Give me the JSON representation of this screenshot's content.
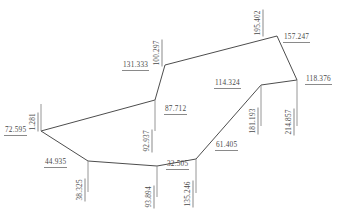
{
  "diagram": {
    "line_color": "#4d4d4d",
    "text_color": "#4a4a4a",
    "underline_color": "#8a8a8a",
    "background": "#ffffff",
    "vertices": [
      {
        "id": "v1",
        "x": 41,
        "y": 131
      },
      {
        "id": "v2",
        "x": 155,
        "y": 100
      },
      {
        "id": "v3",
        "x": 165,
        "y": 65
      },
      {
        "id": "v4",
        "x": 277,
        "y": 36
      },
      {
        "id": "v5",
        "x": 297,
        "y": 80
      },
      {
        "id": "v6",
        "x": 261,
        "y": 85
      },
      {
        "id": "v7",
        "x": 196,
        "y": 159
      },
      {
        "id": "v8",
        "x": 157,
        "y": 166
      },
      {
        "id": "v9",
        "x": 88,
        "y": 161
      }
    ],
    "edges": [
      {
        "from": "v1",
        "to": "v2"
      },
      {
        "from": "v2",
        "to": "v3"
      },
      {
        "from": "v3",
        "to": "v4"
      },
      {
        "from": "v4",
        "to": "v5"
      },
      {
        "from": "v5",
        "to": "v6"
      },
      {
        "from": "v6",
        "to": "v7"
      },
      {
        "from": "v7",
        "to": "v8"
      },
      {
        "from": "v8",
        "to": "v9"
      },
      {
        "from": "v9",
        "to": "v1"
      }
    ],
    "ticks": [
      {
        "id": "t-1281",
        "x1": 41,
        "y1": 131,
        "x2": 41,
        "y2": 104
      },
      {
        "id": "t-92937",
        "x1": 155,
        "y1": 100,
        "x2": 155,
        "y2": 131
      },
      {
        "id": "t-38325",
        "x1": 88,
        "y1": 161,
        "x2": 88,
        "y2": 192
      },
      {
        "id": "t-93894",
        "x1": 157,
        "y1": 166,
        "x2": 157,
        "y2": 197
      },
      {
        "id": "t-135246",
        "x1": 196,
        "y1": 159,
        "x2": 196,
        "y2": 193
      },
      {
        "id": "t-181193",
        "x1": 261,
        "y1": 85,
        "x2": 261,
        "y2": 126
      },
      {
        "id": "t-214857",
        "x1": 297,
        "y1": 80,
        "x2": 297,
        "y2": 126
      }
    ],
    "labels": [
      {
        "id": "d-72595",
        "text": "72.595",
        "x": 4,
        "y": 126,
        "rotated": false
      },
      {
        "id": "d-1281",
        "text": "1.281",
        "x": 38,
        "y": 122,
        "rotated": true
      },
      {
        "id": "d-44935",
        "text": "44.935",
        "x": 44,
        "y": 158,
        "rotated": false
      },
      {
        "id": "d-38325",
        "text": "38.325",
        "x": 85,
        "y": 192,
        "rotated": true
      },
      {
        "id": "d-87712",
        "text": "87.712",
        "x": 164,
        "y": 105,
        "rotated": false
      },
      {
        "id": "d-92937",
        "text": "92.937",
        "x": 152,
        "y": 143,
        "rotated": true
      },
      {
        "id": "d-93894",
        "text": "93.894",
        "x": 154,
        "y": 199,
        "rotated": true
      },
      {
        "id": "d-32505",
        "text": "32.505",
        "x": 166,
        "y": 160,
        "rotated": false
      },
      {
        "id": "d-135246",
        "text": "135.246",
        "x": 193,
        "y": 198,
        "rotated": true
      },
      {
        "id": "d-61405",
        "text": "61.405",
        "x": 215,
        "y": 141,
        "rotated": false
      },
      {
        "id": "d-131333",
        "text": "131.333",
        "x": 122,
        "y": 61,
        "rotated": false
      },
      {
        "id": "d-100297",
        "text": "100.297",
        "x": 162,
        "y": 57,
        "rotated": true
      },
      {
        "id": "d-195402",
        "text": "195.402",
        "x": 263,
        "y": 27,
        "rotated": true
      },
      {
        "id": "d-157247",
        "text": "157.247",
        "x": 283,
        "y": 33,
        "rotated": false
      },
      {
        "id": "d-114324",
        "text": "114.324",
        "x": 214,
        "y": 79,
        "rotated": false
      },
      {
        "id": "d-181193",
        "text": "181.193",
        "x": 258,
        "y": 125,
        "rotated": true
      },
      {
        "id": "d-214857",
        "text": "214.857",
        "x": 294,
        "y": 126,
        "rotated": true
      },
      {
        "id": "d-118376",
        "text": "118.376",
        "x": 305,
        "y": 75,
        "rotated": false
      }
    ]
  }
}
